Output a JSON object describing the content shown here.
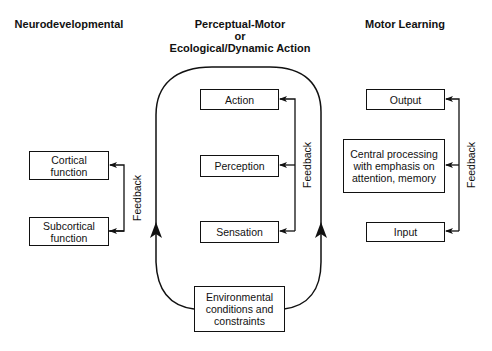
{
  "headings": {
    "neuro": "Neurodevelopmental",
    "perceptual_line1": "Perceptual-Motor",
    "perceptual_line2": "or",
    "perceptual_line3": "Ecological/Dynamic Action",
    "motor_learning": "Motor Learning"
  },
  "neuro": {
    "boxes": [
      "Cortical function",
      "Subcortical function"
    ],
    "feedback_label": "Feedback"
  },
  "perceptual": {
    "boxes": [
      "Action",
      "Perception",
      "Sensation"
    ],
    "feedback_label": "Feedback",
    "environment_box": "Environmental conditions and constraints"
  },
  "motor_learning": {
    "boxes": [
      "Output",
      "Central processing with emphasis on attention, memory",
      "Input"
    ],
    "feedback_label": "Feedback"
  },
  "colors": {
    "line": "#111111",
    "background": "#ffffff"
  }
}
